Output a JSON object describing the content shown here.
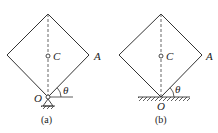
{
  "panels": [
    {
      "id": "a",
      "caption": "(a)",
      "labels": {
        "center": "C",
        "corner": "A",
        "pivot": "O",
        "angle": "θ"
      },
      "support": "pin-support"
    },
    {
      "id": "b",
      "caption": "(b)",
      "labels": {
        "center": "C",
        "corner": "A",
        "pivot": "O",
        "angle": "θ"
      },
      "support": "smooth-ground"
    }
  ],
  "colors": {
    "line": "#333333",
    "dashed": "#555555"
  }
}
